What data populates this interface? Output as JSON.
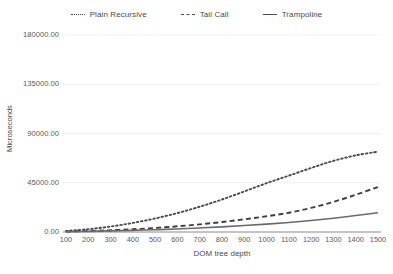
{
  "chart_data": {
    "type": "line",
    "title": "",
    "xlabel": "DOM tree depth",
    "ylabel": "Microseconds",
    "xlim": [
      100,
      1500
    ],
    "ylim": [
      0,
      180000
    ],
    "grid": true,
    "legend_position": "top-center",
    "xticks": [
      "100",
      "200",
      "300",
      "400",
      "500",
      "600",
      "700",
      "800",
      "900",
      "1000",
      "1100",
      "1200",
      "1300",
      "1400",
      "1500"
    ],
    "yticks": [
      "0.00",
      "45000.00",
      "90000.00",
      "135000.00",
      "180000.00"
    ],
    "x": [
      100,
      200,
      300,
      400,
      500,
      600,
      700,
      800,
      900,
      1000,
      1100,
      1200,
      1300,
      1400,
      1500
    ],
    "series": [
      {
        "name": "Plain Recursive",
        "style": "dotted",
        "color": "#4c4c4c",
        "values": [
          900,
          2600,
          5000,
          8300,
          12400,
          17300,
          23100,
          29700,
          37100,
          44600,
          51500,
          58500,
          65000,
          70000,
          73400
        ]
      },
      {
        "name": "Tail Call",
        "style": "dashed",
        "color": "#3f3f3f",
        "values": [
          400,
          900,
          1600,
          2500,
          3700,
          5200,
          7000,
          9100,
          11600,
          14400,
          17600,
          22000,
          27500,
          34000,
          41100
        ]
      },
      {
        "name": "Trampoline",
        "style": "solid",
        "color": "#6a6a6a",
        "values": [
          250,
          600,
          1000,
          1500,
          2100,
          2800,
          3700,
          4700,
          5900,
          7200,
          8700,
          10500,
          12600,
          15000,
          17600
        ]
      }
    ]
  },
  "legend": {
    "items": [
      {
        "label": "Plain Recursive",
        "style": "dotted"
      },
      {
        "label": "Tail Call",
        "style": "dashed"
      },
      {
        "label": "Trampoline",
        "style": "solid"
      }
    ]
  },
  "axes": {
    "x_title": "DOM tree depth",
    "y_title": "Microseconds"
  },
  "colors": {
    "background": "#ffffff",
    "grid": "#f0f0f0",
    "axis": "#8a8a8a",
    "text": "#5a5a5a"
  }
}
